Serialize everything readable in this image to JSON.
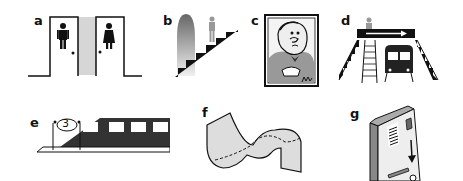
{
  "panels": [
    {
      "id": "a",
      "label": "a",
      "depicts": "restroom doors with male and female signs"
    },
    {
      "id": "b",
      "label": "b",
      "depicts": "person standing on staircase beside tall arch"
    },
    {
      "id": "c",
      "label": "c",
      "depicts": "portrait of an older man"
    },
    {
      "id": "d",
      "label": "d",
      "depicts": "station platform with arrow sign, track and train"
    },
    {
      "id": "e",
      "label": "e",
      "depicts": "platform number 3 sign beside train"
    },
    {
      "id": "f",
      "label": "f",
      "depicts": "winding road with dashed centerline"
    },
    {
      "id": "g",
      "label": "g",
      "depicts": "ticket machine with downward arrow"
    }
  ],
  "platform_sign": {
    "number": "3"
  },
  "colors": {
    "ink": "#111111",
    "gray": "#b8b8b8",
    "light": "#e2e2e2"
  }
}
